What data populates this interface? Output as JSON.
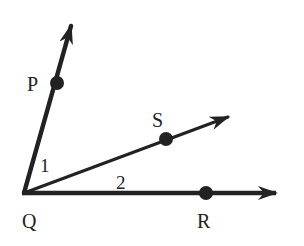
{
  "diagram": {
    "colors": {
      "stroke": "#222222",
      "background": "#ffffff"
    },
    "vertex": {
      "label": "Q",
      "x": 24,
      "y": 193
    },
    "rays": [
      {
        "name": "QP",
        "point_label": "P",
        "point": [
          57,
          83
        ],
        "tip": [
          72,
          22
        ]
      },
      {
        "name": "QS",
        "point_label": "S",
        "point": [
          166,
          139
        ],
        "tip": [
          231,
          116
        ]
      },
      {
        "name": "QR",
        "point_label": "R",
        "point": [
          206,
          193
        ],
        "tip": [
          279,
          193
        ]
      }
    ],
    "labels": {
      "P": "P",
      "Q": "Q",
      "R": "R",
      "S": "S",
      "angle1": "1",
      "angle2": "2"
    }
  }
}
